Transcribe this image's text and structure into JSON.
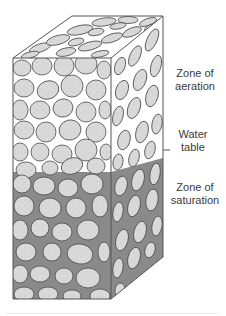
{
  "figure": {
    "labels": {
      "aeration": [
        "Zone of",
        "aeration"
      ],
      "water_table": [
        "Water",
        "table"
      ],
      "saturation": [
        "Zone of",
        "saturation"
      ]
    },
    "colors": {
      "pebble_fill": "#d9d9d9",
      "pebble_outline": "#4a4a4a",
      "pore_air": "#ffffff",
      "pore_water": "#8a8a8a",
      "edge": "#555555"
    }
  }
}
